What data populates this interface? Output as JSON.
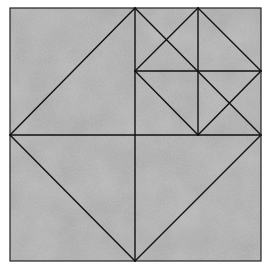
{
  "diagram": {
    "kind": "geometric-dissection",
    "background": {
      "fill": "#a4a4a4",
      "texture_dark": "#8c8c8c",
      "texture_light": "#b8b8b8",
      "page": "#ffffff"
    },
    "stroke": "#111111",
    "frame": {
      "x": 10,
      "y": 8,
      "w": 251,
      "h": 253
    },
    "lines": [
      {
        "id": "big-diamond-tl",
        "x1": 135,
        "y1": 8,
        "x2": 10,
        "y2": 135
      },
      {
        "id": "big-diamond-bl",
        "x1": 10,
        "y1": 135,
        "x2": 135,
        "y2": 261
      },
      {
        "id": "big-diamond-br",
        "x1": 135,
        "y1": 261,
        "x2": 261,
        "y2": 135
      },
      {
        "id": "big-diamond-tr",
        "x1": 261,
        "y1": 135,
        "x2": 135,
        "y2": 8
      },
      {
        "id": "center-vertical",
        "x1": 135,
        "y1": 8,
        "x2": 135,
        "y2": 261
      },
      {
        "id": "center-horizontal",
        "x1": 10,
        "y1": 135,
        "x2": 261,
        "y2": 135
      },
      {
        "id": "small-diamond-tl",
        "x1": 198,
        "y1": 8,
        "x2": 135,
        "y2": 71
      },
      {
        "id": "small-diamond-bl",
        "x1": 135,
        "y1": 71,
        "x2": 198,
        "y2": 135
      },
      {
        "id": "small-diamond-br",
        "x1": 198,
        "y1": 135,
        "x2": 261,
        "y2": 71
      },
      {
        "id": "small-diamond-tr",
        "x1": 261,
        "y1": 71,
        "x2": 198,
        "y2": 8
      },
      {
        "id": "small-vertical",
        "x1": 198,
        "y1": 8,
        "x2": 198,
        "y2": 135
      },
      {
        "id": "small-horizontal",
        "x1": 135,
        "y1": 71,
        "x2": 261,
        "y2": 71
      }
    ]
  }
}
